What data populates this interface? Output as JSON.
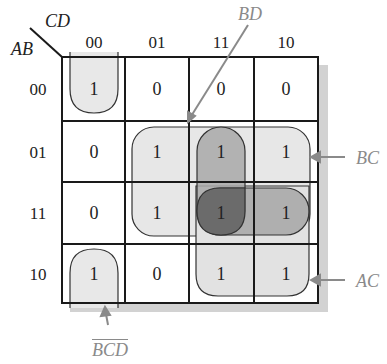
{
  "axes": {
    "row_var": "AB",
    "col_var": "CD",
    "col_labels": [
      "00",
      "01",
      "11",
      "10"
    ],
    "row_labels": [
      "00",
      "01",
      "11",
      "10"
    ]
  },
  "cells": [
    [
      "1",
      "0",
      "0",
      "0"
    ],
    [
      "0",
      "1",
      "1",
      "1"
    ],
    [
      "0",
      "1",
      "1",
      "1"
    ],
    [
      "1",
      "0",
      "1",
      "1"
    ]
  ],
  "groups": {
    "bd": {
      "label": "BD",
      "shade": "#a9a9a9"
    },
    "bc": {
      "label": "BC",
      "shade": "#e6e6e6"
    },
    "ac": {
      "label": "AC",
      "shade": "#e0e0e0"
    },
    "abd": {
      "shade": "#a0a0a0"
    },
    "bcd_not": {
      "label_letters": [
        "B",
        "C",
        "D"
      ],
      "label_overbars": true,
      "shade": "#e8e8e8"
    }
  },
  "colors": {
    "grid": "#1a1a1a",
    "shadow": "#cfcfcf",
    "annotation": "#8a8a8a",
    "overlap_dark": "#6b6b6b"
  }
}
